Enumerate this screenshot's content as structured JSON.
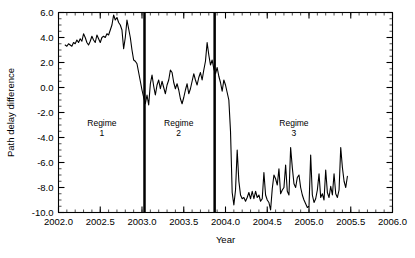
{
  "chart_data": {
    "type": "line",
    "title": "",
    "xlabel": "Year",
    "ylabel": "Path delay difference",
    "xlim": [
      2002.0,
      2006.0
    ],
    "ylim": [
      -10.0,
      6.0
    ],
    "xticks": [
      2002.0,
      2002.5,
      2003.0,
      2003.5,
      2004.0,
      2004.5,
      2005.0,
      2005.5,
      2006.0
    ],
    "xtick_labels": [
      "2002.0",
      "2002.5",
      "2003.0",
      "2003.5",
      "2004.0",
      "2004.5",
      "2005.0",
      "2005.5",
      "2006.0"
    ],
    "yticks": [
      6.0,
      4.0,
      2.0,
      0.0,
      -2.0,
      -4.0,
      -6.0,
      -8.0,
      -10.0
    ],
    "ytick_labels": [
      "6.0",
      "4.0",
      "2.0",
      "0.0",
      "-2.0",
      "-4.0",
      "-6.0",
      "-8.0",
      "-10.0"
    ],
    "x_minor_step": 0.1,
    "y_minor_step": 0.5,
    "grid": false,
    "legend": "none",
    "line_color": "#000000",
    "line_width": 1.1,
    "annotations": [
      {
        "name": "regime-1",
        "text_line1": "Regime",
        "text_line2": "1",
        "x": 2002.52,
        "y": -3.1
      },
      {
        "name": "regime-2",
        "text_line1": "Regime",
        "text_line2": "2",
        "x": 2003.44,
        "y": -3.1
      },
      {
        "name": "regime-3",
        "text_line1": "Regime",
        "text_line2": "3",
        "x": 2004.82,
        "y": -3.1
      }
    ],
    "vertical_dividers": [
      {
        "name": "regime-divider-1",
        "x": 2003.03,
        "width": 2.5,
        "color": "#000000"
      },
      {
        "name": "regime-divider-2",
        "x": 2003.87,
        "width": 2.5,
        "color": "#000000"
      }
    ],
    "series": [
      {
        "name": "path delay difference",
        "x": [
          2002.08,
          2002.1,
          2002.12,
          2002.14,
          2002.16,
          2002.18,
          2002.2,
          2002.22,
          2002.24,
          2002.26,
          2002.28,
          2002.3,
          2002.32,
          2002.34,
          2002.36,
          2002.38,
          2002.4,
          2002.42,
          2002.44,
          2002.46,
          2002.48,
          2002.5,
          2002.52,
          2002.54,
          2002.56,
          2002.58,
          2002.6,
          2002.62,
          2002.64,
          2002.66,
          2002.68,
          2002.7,
          2002.72,
          2002.74,
          2002.76,
          2002.78,
          2002.8,
          2002.82,
          2002.84,
          2002.86,
          2002.88,
          2002.9,
          2002.92,
          2002.94,
          2002.96,
          2002.98,
          2003.0,
          2003.02,
          2003.04,
          2003.06,
          2003.08,
          2003.1,
          2003.12,
          2003.14,
          2003.16,
          2003.18,
          2003.2,
          2003.22,
          2003.24,
          2003.26,
          2003.28,
          2003.3,
          2003.32,
          2003.34,
          2003.36,
          2003.38,
          2003.4,
          2003.42,
          2003.44,
          2003.46,
          2003.48,
          2003.5,
          2003.52,
          2003.54,
          2003.56,
          2003.58,
          2003.6,
          2003.62,
          2003.64,
          2003.66,
          2003.68,
          2003.7,
          2003.72,
          2003.74,
          2003.76,
          2003.78,
          2003.8,
          2003.82,
          2003.84,
          2003.86,
          2003.88,
          2003.9,
          2003.92,
          2003.94,
          2003.96,
          2003.98,
          2004.0,
          2004.02,
          2004.04,
          2004.06,
          2004.08,
          2004.1,
          2004.12,
          2004.14,
          2004.16,
          2004.18,
          2004.2,
          2004.22,
          2004.24,
          2004.26,
          2004.28,
          2004.3,
          2004.32,
          2004.34,
          2004.36,
          2004.38,
          2004.4,
          2004.42,
          2004.44,
          2004.46,
          2004.48,
          2004.5,
          2004.52,
          2004.54,
          2004.56,
          2004.58,
          2004.6,
          2004.62,
          2004.64,
          2004.66,
          2004.68,
          2004.7,
          2004.72,
          2004.74,
          2004.76,
          2004.78,
          2004.8,
          2004.82,
          2004.84,
          2004.86,
          2004.88,
          2004.9,
          2004.92,
          2004.94,
          2004.96,
          2004.98,
          2005.0,
          2005.02,
          2005.04,
          2005.06,
          2005.08,
          2005.1,
          2005.12,
          2005.14,
          2005.16,
          2005.18,
          2005.2,
          2005.22,
          2005.24,
          2005.26,
          2005.28,
          2005.3,
          2005.32,
          2005.34,
          2005.36,
          2005.38,
          2005.4,
          2005.42,
          2005.44,
          2005.46
        ],
        "y": [
          3.4,
          3.3,
          3.5,
          3.4,
          3.3,
          3.6,
          3.5,
          3.8,
          3.6,
          3.9,
          3.7,
          4.3,
          4.0,
          3.6,
          3.4,
          3.7,
          4.1,
          3.8,
          3.6,
          4.2,
          3.9,
          3.6,
          4.0,
          4.1,
          4.0,
          4.3,
          4.2,
          4.6,
          5.0,
          5.8,
          5.4,
          5.6,
          5.2,
          5.0,
          4.6,
          3.1,
          4.0,
          5.4,
          4.7,
          4.0,
          3.0,
          2.2,
          2.1,
          1.9,
          1.2,
          0.5,
          -0.2,
          -0.8,
          -1.3,
          -0.6,
          -1.4,
          0.3,
          1.0,
          0.1,
          -0.6,
          0.2,
          0.6,
          -0.1,
          0.5,
          0.0,
          -0.5,
          0.2,
          0.6,
          1.4,
          1.2,
          0.4,
          -0.1,
          0.3,
          -0.2,
          -0.9,
          -1.3,
          -0.8,
          -0.2,
          0.3,
          -0.5,
          -0.1,
          0.5,
          1.1,
          0.6,
          0.2,
          0.8,
          1.2,
          0.6,
          1.4,
          2.1,
          3.6,
          2.6,
          1.8,
          2.2,
          1.5,
          1.1,
          1.6,
          0.9,
          0.4,
          -0.3,
          0.6,
          0.2,
          -0.4,
          -1.0,
          -3.5,
          -8.4,
          -9.4,
          -8.2,
          -5.0,
          -7.5,
          -8.6,
          -8.9,
          -8.8,
          -9.1,
          -8.8,
          -8.4,
          -8.9,
          -8.3,
          -8.9,
          -8.3,
          -8.8,
          -8.6,
          -9.1,
          -8.9,
          -6.8,
          -8.6,
          -9.0,
          -9.2,
          -9.8,
          -8.1,
          -7.0,
          -7.3,
          -7.8,
          -6.5,
          -8.5,
          -8.2,
          -8.0,
          -6.2,
          -8.3,
          -8.6,
          -4.8,
          -6.4,
          -7.7,
          -8.0,
          -7.2,
          -7.0,
          -8.0,
          -8.6,
          -9.0,
          -9.3,
          -9.6,
          -9.5,
          -5.4,
          -8.6,
          -9.2,
          -8.9,
          -8.2,
          -6.9,
          -8.8,
          -8.5,
          -9.0,
          -6.6,
          -8.4,
          -8.8,
          -7.9,
          -8.6,
          -6.9,
          -8.5,
          -8.8,
          -8.2,
          -4.8,
          -6.4,
          -7.5,
          -8.0,
          -7.1
        ]
      }
    ]
  }
}
